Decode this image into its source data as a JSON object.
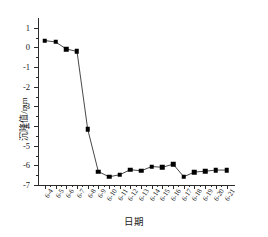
{
  "chart_data": {
    "type": "line",
    "title": "",
    "xlabel": "日期",
    "ylabel": "沉降值/mm",
    "ylim": [
      -7,
      1.5
    ],
    "yticks": [
      1,
      0,
      -1,
      -2,
      -3,
      -4,
      -5,
      -6,
      -7
    ],
    "ytick_labels": [
      "1",
      "0",
      "-1",
      "-2",
      "-3",
      "-4",
      "-5",
      "-6",
      "-7"
    ],
    "grid": false,
    "legend": false,
    "marker": "filled-square",
    "line_color": "#333333",
    "marker_color": "#000000",
    "categories": [
      "6-4",
      "6-5",
      "6-6",
      "6-7",
      "6-8",
      "6-9",
      "6-10",
      "6-11",
      "6-12",
      "6-13",
      "6-14",
      "6-15",
      "6-16",
      "6-17",
      "6-18",
      "6-19",
      "6-20",
      "6-21"
    ],
    "values": [
      0.35,
      0.28,
      -0.08,
      -0.2,
      -4.15,
      -6.32,
      -6.58,
      -6.48,
      -6.22,
      -6.28,
      -6.06,
      -6.1,
      -5.94,
      -6.58,
      -6.34,
      -6.3,
      -6.24,
      -6.24
    ],
    "series": [
      {
        "name": "沉降值",
        "values": [
          0.35,
          0.28,
          -0.08,
          -0.2,
          -4.15,
          -6.32,
          -6.58,
          -6.48,
          -6.22,
          -6.28,
          -6.06,
          -6.1,
          -5.94,
          -6.58,
          -6.34,
          -6.3,
          -6.24,
          -6.24
        ]
      }
    ]
  }
}
